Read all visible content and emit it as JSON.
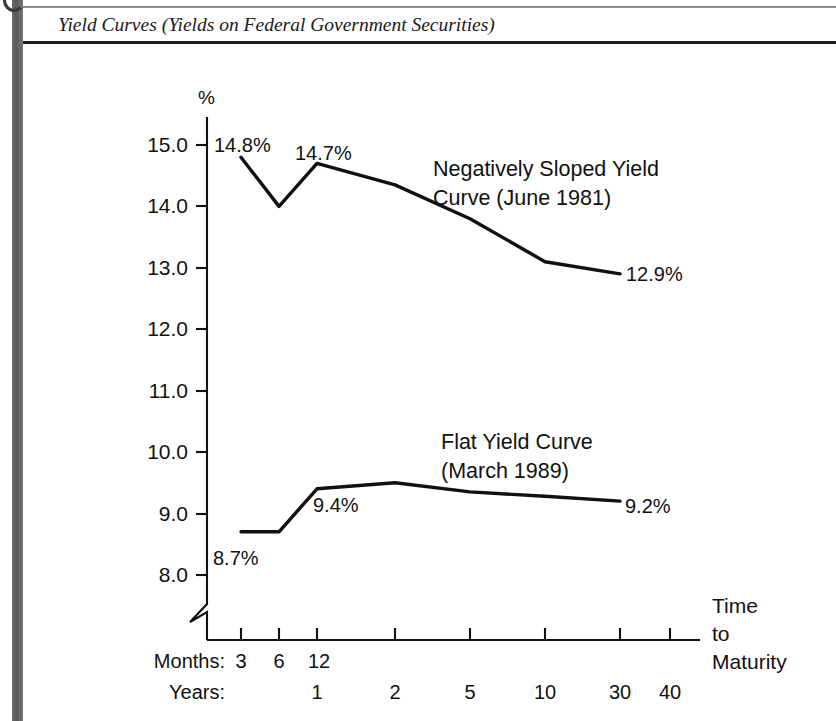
{
  "page": {
    "title": "Yield Curves (Yields on Federal Government Securities)"
  },
  "chart_data": {
    "type": "line",
    "title": "Yield Curves (Yields on Federal Government Securities)",
    "xlabel": "Time to Maturity",
    "ylabel": "%",
    "ylim": [
      8.0,
      15.0
    ],
    "grid": false,
    "axis_break": true,
    "legend": "inline-annotation",
    "yticks": [
      "15.0",
      "14.0",
      "13.0",
      "12.0",
      "11.0",
      "10.0",
      "9.0",
      "8.0"
    ],
    "ytick_values": [
      15.0,
      14.0,
      13.0,
      12.0,
      11.0,
      10.0,
      9.0,
      8.0
    ],
    "x_axis_rows": [
      {
        "name": "Months:",
        "labels": [
          "3",
          "6",
          "12",
          "",
          "",
          "",
          "",
          ""
        ]
      },
      {
        "name": "Years:",
        "labels": [
          "",
          "",
          "1",
          "2",
          "5",
          "10",
          "30",
          "40"
        ]
      }
    ],
    "x_categories": [
      "3 months",
      "6 months",
      "12 months / 1 year",
      "2 years",
      "5 years",
      "10 years",
      "30 years",
      "40 years"
    ],
    "series": [
      {
        "name": "Negatively Sloped Yield Curve (June 1981)",
        "label_line1": "Negatively Sloped Yield",
        "label_line2": "Curve (June 1981)",
        "values": [
          14.8,
          14.0,
          14.7,
          14.35,
          13.8,
          13.1,
          12.9,
          null
        ],
        "point_labels": [
          {
            "at": 0,
            "text": "14.8%"
          },
          {
            "at": 2,
            "text": "14.7%"
          },
          {
            "at": 6,
            "text": "12.9%"
          }
        ]
      },
      {
        "name": "Flat Yield Curve (March 1989)",
        "label_line1": "Flat Yield Curve",
        "label_line2": "(March 1989)",
        "values": [
          8.7,
          8.7,
          9.4,
          9.5,
          9.35,
          9.28,
          9.2,
          null
        ],
        "point_labels": [
          {
            "at": 0,
            "text": "8.7%"
          },
          {
            "at": 2,
            "text": "9.4%"
          },
          {
            "at": 6,
            "text": "9.2%"
          }
        ]
      }
    ],
    "axis_title_lines": [
      "Time",
      "to",
      "Maturity"
    ]
  },
  "colors": {
    "ink": "#111111",
    "gutter": "#606060",
    "rule_light": "#8d8d8d",
    "rule_dark": "#1d1d1d",
    "background": "#ffffff"
  }
}
